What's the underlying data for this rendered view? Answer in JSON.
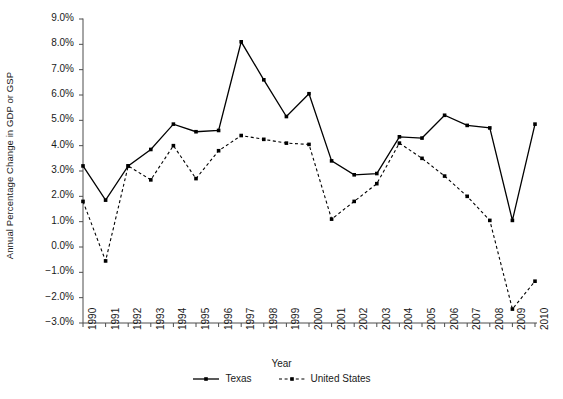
{
  "chart_data": {
    "type": "line",
    "title": "",
    "xlabel": "Year",
    "ylabel": "Annual Percentage Change in GDP or GSP",
    "grid": false,
    "legend_position": "bottom-center",
    "xlim": [
      1990,
      2010
    ],
    "ylim": [
      -3.0,
      9.0
    ],
    "ytick_labels": [
      "9.0%",
      "8.0%",
      "7.0%",
      "6.0%",
      "5.0%",
      "4.0%",
      "3.0%",
      "2.0%",
      "1.0%",
      "0.0%",
      "−1.0%",
      "−2.0%",
      "−3.0%"
    ],
    "ytick_values": [
      9.0,
      8.0,
      7.0,
      6.0,
      5.0,
      4.0,
      3.0,
      2.0,
      1.0,
      0.0,
      -1.0,
      -2.0,
      -3.0
    ],
    "categories": [
      "1990",
      "1991",
      "1992",
      "1993",
      "1994",
      "1995",
      "1996",
      "1997",
      "1998",
      "1999",
      "2000",
      "2001",
      "2002",
      "2003",
      "2004",
      "2005",
      "2006",
      "2007",
      "2008",
      "2009",
      "2010"
    ],
    "series": [
      {
        "name": "Texas",
        "style": "solid",
        "color": "#000000",
        "marker": "square",
        "values": [
          3.2,
          1.85,
          3.2,
          3.85,
          4.85,
          4.55,
          4.6,
          8.1,
          6.6,
          5.15,
          6.05,
          3.4,
          2.85,
          2.9,
          4.35,
          4.3,
          5.2,
          4.8,
          4.7,
          1.05,
          4.85
        ]
      },
      {
        "name": "United States",
        "style": "dashed",
        "color": "#000000",
        "marker": "square",
        "values": [
          1.8,
          -0.55,
          3.2,
          2.65,
          4.0,
          2.7,
          3.8,
          4.4,
          4.25,
          4.1,
          4.05,
          1.1,
          1.8,
          2.5,
          4.1,
          3.5,
          2.8,
          2.0,
          1.05,
          -2.45,
          -1.35
        ]
      }
    ]
  },
  "legend": {
    "entries": [
      {
        "label": "Texas"
      },
      {
        "label": "United States"
      }
    ]
  },
  "colors": {
    "axis": "#4d4d4d",
    "text": "#1a1a1a",
    "series_texas": "#000000",
    "series_us": "#000000"
  }
}
